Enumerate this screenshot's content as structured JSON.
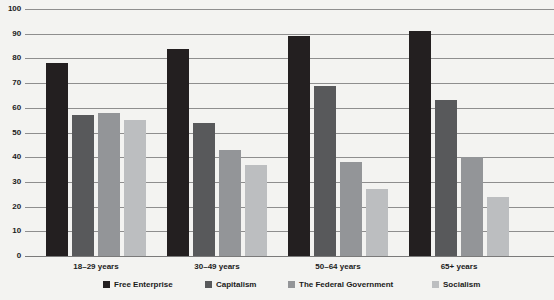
{
  "chart_data": {
    "type": "bar",
    "title": "",
    "subtitle": "",
    "xlabel": "",
    "ylabel": "",
    "ylim": [
      0,
      100
    ],
    "ytick_labels": [
      "100",
      "90",
      "80",
      "70",
      "60",
      "50",
      "40",
      "30",
      "20",
      "10",
      "0"
    ],
    "ytick_values": [
      100,
      90,
      80,
      70,
      60,
      50,
      40,
      30,
      20,
      10,
      0
    ],
    "grid": true,
    "legend_position": "bottom",
    "categories": [
      "18–29 years",
      "30–49 years",
      "50–64 years",
      "65+ years"
    ],
    "series": [
      {
        "name": "Free Enterprise",
        "color": "#231f20",
        "values": [
          78,
          84,
          89,
          91
        ]
      },
      {
        "name": "Capitalism",
        "color": "#58595b",
        "values": [
          57,
          54,
          69,
          63
        ]
      },
      {
        "name": "The Federal Government",
        "color": "#939598",
        "values": [
          58,
          43,
          38,
          40
        ]
      },
      {
        "name": "Socialism",
        "color": "#bcbec0",
        "values": [
          55,
          37,
          27,
          24
        ]
      }
    ]
  },
  "colors": {
    "background": "#f3f3f1",
    "gridline": "#8e8e8e",
    "text": "#1b1b1b",
    "series_1": "#231f20",
    "series_2": "#58595b",
    "series_3": "#939598",
    "series_4": "#bcbec0"
  }
}
